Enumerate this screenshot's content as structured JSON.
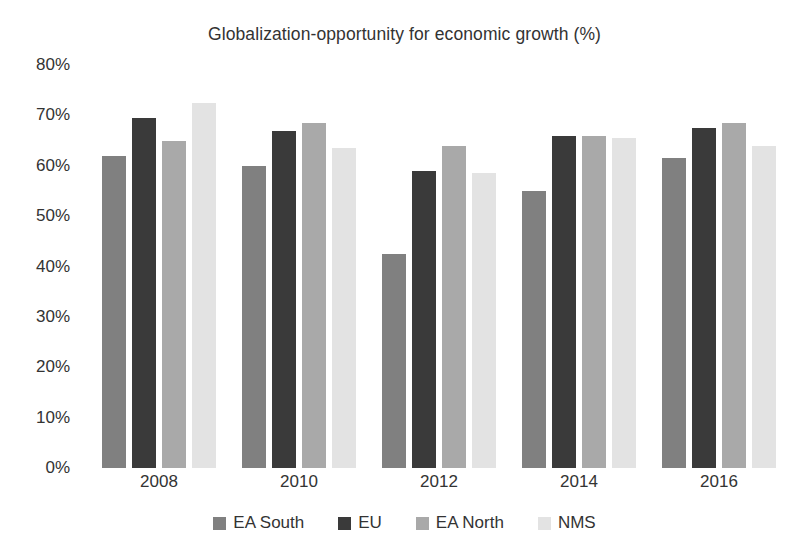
{
  "chart_data": {
    "type": "bar",
    "title": "Globalization-opportunity for economic growth (%)",
    "xlabel": "",
    "ylabel": "",
    "ylim": [
      0,
      80
    ],
    "ytick_step": 10,
    "ytick_labels": [
      "80%",
      "70%",
      "60%",
      "50%",
      "40%",
      "30%",
      "20%",
      "10%",
      "0%"
    ],
    "ytick_values": [
      80,
      70,
      60,
      50,
      40,
      30,
      20,
      10,
      0
    ],
    "grid": false,
    "legend_position": "bottom",
    "categories": [
      "2008",
      "2010",
      "2012",
      "2014",
      "2016"
    ],
    "series": [
      {
        "name": "EA South",
        "color": "#808080",
        "values": [
          62,
          60,
          42.5,
          55,
          61.5
        ]
      },
      {
        "name": "EU",
        "color": "#3a3a3a",
        "values": [
          69.5,
          67,
          59,
          66,
          67.5
        ]
      },
      {
        "name": "EA North",
        "color": "#a9a9a9",
        "values": [
          65,
          68.5,
          64,
          66,
          68.5
        ]
      },
      {
        "name": "NMS",
        "color": "#e3e3e3",
        "values": [
          72.5,
          63.5,
          58.5,
          65.5,
          64
        ]
      }
    ]
  }
}
